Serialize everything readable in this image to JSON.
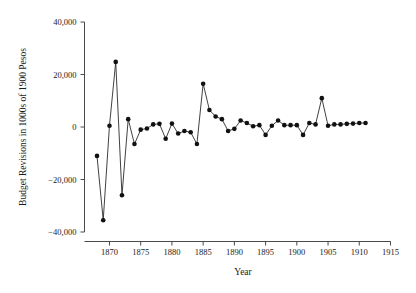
{
  "chart_data": {
    "type": "line",
    "title": "",
    "xlabel": "Year",
    "ylabel": "Budget Revisions in 1000s of 1900 Pesos",
    "xlim": [
      1866,
      1915
    ],
    "ylim": [
      -40000,
      40000
    ],
    "xticks": [
      1870,
      1875,
      1880,
      1885,
      1890,
      1895,
      1900,
      1905,
      1910,
      1915
    ],
    "xtick_labels": [
      "1870",
      "1875",
      "1880",
      "1885",
      "1890",
      "1895",
      "1900",
      "1905",
      "1910",
      "1915"
    ],
    "yticks": [
      -40000,
      -20000,
      0,
      20000,
      40000
    ],
    "ytick_labels": [
      "-40,000",
      "-20,000",
      "0",
      "20,000",
      "40,000"
    ],
    "grid": false,
    "legend": false,
    "marker": "filled-circle",
    "line_color": "#2b2b2b",
    "marker_color": "#111111",
    "x": [
      1868,
      1869,
      1870,
      1871,
      1872,
      1873,
      1874,
      1875,
      1876,
      1877,
      1878,
      1879,
      1880,
      1881,
      1882,
      1883,
      1884,
      1885,
      1886,
      1887,
      1888,
      1889,
      1890,
      1891,
      1892,
      1893,
      1894,
      1895,
      1896,
      1897,
      1898,
      1899,
      1900,
      1901,
      1902,
      1903,
      1904,
      1905,
      1906,
      1907,
      1908,
      1909,
      1910,
      1911
    ],
    "values": [
      -11000,
      -35500,
      500,
      24800,
      -26000,
      3000,
      -6500,
      -1000,
      -600,
      1000,
      1200,
      -4500,
      1300,
      -2500,
      -1500,
      -2000,
      -6500,
      16500,
      6500,
      4000,
      3000,
      -1500,
      -700,
      2500,
      1500,
      300,
      700,
      -3000,
      500,
      2500,
      700,
      700,
      700,
      -3000,
      1500,
      1000,
      11000,
      500,
      1000,
      1000,
      1200,
      1300,
      1500,
      1500
    ]
  },
  "axes": {
    "y_axis_title": "Budget Revisions in 1000s of 1900 Pesos",
    "x_axis_title": "Year"
  }
}
